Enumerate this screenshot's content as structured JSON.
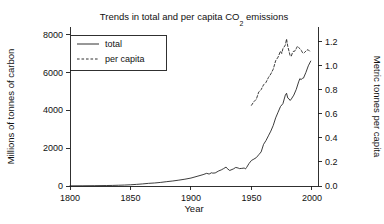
{
  "chart_data": {
    "type": "line",
    "title": "Trends in total and per capita CO2 emissions",
    "title_parts": {
      "before": "Trends in total and per capita CO",
      "sub": "2",
      "after": " emissions"
    },
    "xlabel": "Year",
    "ylabel": "Millions of tonnes of carbon",
    "y2label": "Metric tonnes per capita",
    "xlim": [
      1800,
      2005
    ],
    "ylim": [
      0,
      8400
    ],
    "y2lim": [
      0,
      1.32
    ],
    "xticks": [
      1800,
      1850,
      1900,
      1950,
      2000
    ],
    "xtick_labels": [
      "1800",
      "1850",
      "1900",
      "1950",
      "2000"
    ],
    "yticks": [
      0,
      2000,
      4000,
      6000,
      8000
    ],
    "ytick_labels": [
      "0",
      "2000",
      "4000",
      "6000",
      "8000"
    ],
    "y2ticks": [
      0.0,
      0.2,
      0.4,
      0.6,
      0.8,
      1.0,
      1.2
    ],
    "y2tick_labels": [
      "0.0",
      "0.2",
      "0.4",
      "0.6",
      "0.8",
      "1.0",
      "1.2"
    ],
    "grid": false,
    "legend_position": "upper-left",
    "series": [
      {
        "name": "total",
        "axis": "left",
        "style": "solid",
        "units": "millions of tonnes of carbon",
        "x": [
          1800,
          1810,
          1820,
          1830,
          1835,
          1840,
          1845,
          1850,
          1855,
          1860,
          1865,
          1870,
          1875,
          1880,
          1885,
          1890,
          1895,
          1900,
          1905,
          1910,
          1913,
          1915,
          1917,
          1918,
          1920,
          1923,
          1925,
          1927,
          1929,
          1930,
          1932,
          1935,
          1937,
          1939,
          1940,
          1942,
          1944,
          1945,
          1946,
          1948,
          1950,
          1952,
          1954,
          1956,
          1958,
          1960,
          1962,
          1964,
          1966,
          1968,
          1970,
          1972,
          1974,
          1976,
          1978,
          1979,
          1980,
          1981,
          1982,
          1983,
          1985,
          1987,
          1989,
          1990,
          1991,
          1992,
          1993,
          1995,
          1997,
          1999
        ],
        "values": [
          8,
          12,
          17,
          25,
          30,
          40,
          50,
          65,
          85,
          110,
          140,
          160,
          190,
          230,
          265,
          310,
          360,
          420,
          510,
          600,
          670,
          630,
          700,
          680,
          690,
          800,
          850,
          920,
          1000,
          920,
          820,
          900,
          980,
          950,
          920,
          930,
          950,
          900,
          980,
          1190,
          1350,
          1420,
          1500,
          1650,
          1800,
          2200,
          2400,
          2650,
          2900,
          3200,
          3600,
          3900,
          4200,
          4350,
          4800,
          4900,
          4650,
          4600,
          4520,
          4600,
          4800,
          5100,
          5500,
          5670,
          5620,
          5680,
          5700,
          6000,
          6350,
          6600
        ]
      },
      {
        "name": "per capita",
        "axis": "right",
        "style": "dashed",
        "units": "metric tonnes per capita",
        "x": [
          1950,
          1952,
          1954,
          1956,
          1958,
          1960,
          1962,
          1964,
          1966,
          1968,
          1970,
          1972,
          1974,
          1975,
          1976,
          1978,
          1979,
          1980,
          1981,
          1982,
          1983,
          1984,
          1985,
          1986,
          1987,
          1988,
          1989,
          1990,
          1991,
          1992,
          1993,
          1994,
          1995,
          1996,
          1997,
          1998,
          1999
        ],
        "values": [
          0.67,
          0.7,
          0.72,
          0.78,
          0.8,
          0.84,
          0.86,
          0.9,
          0.93,
          0.97,
          1.04,
          1.07,
          1.12,
          1.1,
          1.14,
          1.17,
          1.22,
          1.16,
          1.12,
          1.08,
          1.08,
          1.11,
          1.12,
          1.12,
          1.14,
          1.16,
          1.15,
          1.14,
          1.13,
          1.11,
          1.1,
          1.11,
          1.12,
          1.13,
          1.13,
          1.12,
          1.12
        ]
      }
    ],
    "legend": [
      {
        "label": "total",
        "style": "solid"
      },
      {
        "label": "per capita",
        "style": "dashed"
      }
    ],
    "colors": {
      "ink": "#1a1a1a",
      "background": "#ffffff"
    }
  }
}
